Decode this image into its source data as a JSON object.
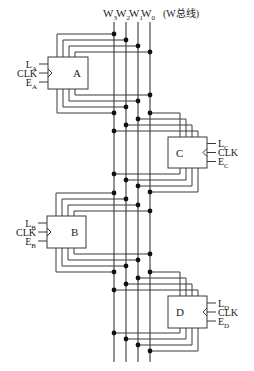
{
  "title": {
    "buses": [
      "W",
      "W",
      "W",
      "W"
    ],
    "bus_subscripts": [
      "3",
      "2",
      "1",
      "0"
    ],
    "caption": "(W总线)"
  },
  "bus": {
    "x": [
      114,
      126,
      138,
      150
    ],
    "top": 22,
    "bottom": 362,
    "color": "#3a3a3a"
  },
  "registers": [
    {
      "name": "A",
      "side": "left",
      "box": {
        "x": 48,
        "y": 57,
        "w": 40,
        "h": 32
      },
      "signals": [
        {
          "main": "L",
          "sub": "A"
        },
        {
          "main": "CLK",
          "sub": ""
        },
        {
          "main": "E",
          "sub": "A"
        }
      ],
      "top_wires_y": [
        34,
        40,
        46,
        52
      ],
      "bottom_wires_y": [
        113,
        107,
        101,
        95
      ]
    },
    {
      "name": "C",
      "side": "right",
      "box": {
        "x": 168,
        "y": 137,
        "w": 39,
        "h": 31
      },
      "signals": [
        {
          "main": "L",
          "sub": "C"
        },
        {
          "main": "CLK",
          "sub": ""
        },
        {
          "main": "E",
          "sub": "C"
        }
      ],
      "top_wires_y": [
        131,
        125,
        119,
        113
      ],
      "bottom_wires_y": [
        174,
        180,
        186,
        192
      ]
    },
    {
      "name": "B",
      "side": "left",
      "box": {
        "x": 47,
        "y": 216,
        "w": 39,
        "h": 32
      },
      "signals": [
        {
          "main": "L",
          "sub": "B"
        },
        {
          "main": "CLK",
          "sub": ""
        },
        {
          "main": "E",
          "sub": "B"
        }
      ],
      "top_wires_y": [
        193,
        199,
        205,
        211
      ],
      "bottom_wires_y": [
        272,
        266,
        260,
        254
      ]
    },
    {
      "name": "D",
      "side": "right",
      "box": {
        "x": 168,
        "y": 296,
        "w": 39,
        "h": 32
      },
      "signals": [
        {
          "main": "L",
          "sub": "D"
        },
        {
          "main": "CLK",
          "sub": ""
        },
        {
          "main": "E",
          "sub": "D"
        }
      ],
      "top_wires_y": [
        290,
        284,
        278,
        272
      ],
      "bottom_wires_y": [
        333,
        339,
        345,
        351
      ]
    }
  ]
}
